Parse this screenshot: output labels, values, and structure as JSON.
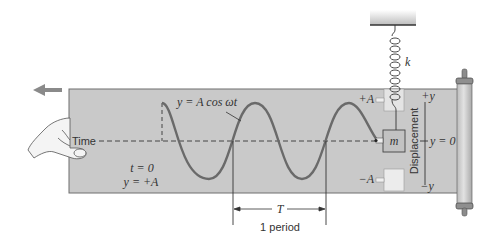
{
  "figure": {
    "labels": {
      "equation": "y = A cos ωt",
      "time": "Time",
      "initial_t": "t = 0",
      "initial_y": "y = +A",
      "plus_A": "+A",
      "minus_A": "−A",
      "mass": "m",
      "spring_constant": "k",
      "plus_y": "+y",
      "minus_y": "−y",
      "y_zero": "y = 0",
      "displacement": "Displacement",
      "period_symbol": "T",
      "period_caption": "1 period"
    },
    "colors": {
      "paper": "#c9c9c9",
      "paper_border": "#6e6e6e",
      "wave": "#6a6a6a",
      "ink": "#333333",
      "arrow": "#8a8a8a",
      "box_light": "#ececec",
      "mass_fill": "#c2c2c2",
      "roller": "#d2d2d2"
    },
    "icons": {
      "motion-arrow": "left-arrow",
      "hand": "hand-holding-paper",
      "spring": "coil-spring",
      "roller": "paper-roll"
    }
  }
}
